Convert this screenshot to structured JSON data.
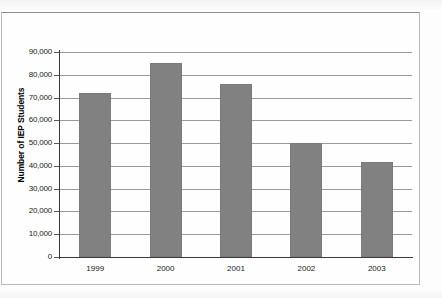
{
  "chart_data": {
    "type": "bar",
    "title": "",
    "subtitle": "",
    "xlabel": "",
    "ylabel": "Number of IEP Students",
    "categories": [
      "1999",
      "2000",
      "2001",
      "2002",
      "2003"
    ],
    "values": [
      72000,
      85000,
      76000,
      50000,
      41500
    ],
    "series": [
      {
        "name": "Number of IEP Students",
        "values": [
          72000,
          85000,
          76000,
          50000,
          41500
        ]
      }
    ],
    "ylim": [
      0,
      90000
    ],
    "ytick_values": [
      0,
      10000,
      20000,
      30000,
      40000,
      50000,
      60000,
      70000,
      80000,
      90000
    ],
    "ytick_labels": [
      "0",
      "10,000",
      "20,000",
      "30,000",
      "40,000",
      "50,000",
      "60,000",
      "70,000",
      "80,000",
      "90,000"
    ],
    "grid": true,
    "grid_axis": "y",
    "legend": false,
    "legend_position": "none",
    "bar_color": "#818181",
    "axis_color": "#3a3a3a",
    "gridline_color": "#9a9a9a",
    "background_color": "#fefefe"
  },
  "figure": {
    "y_axis_title": "Number of IEP Students"
  }
}
